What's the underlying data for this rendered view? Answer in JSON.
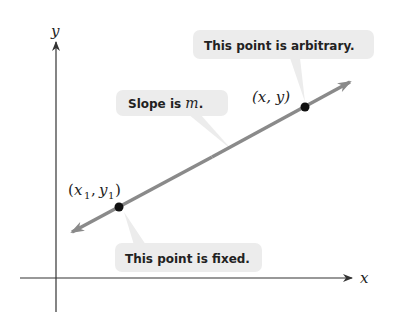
{
  "axes": {
    "x_label": "x",
    "y_label": "y"
  },
  "line": {
    "color": "#8a8a8a",
    "description": "Slope is m."
  },
  "points": {
    "fixed": {
      "label_var1": "x",
      "label_sub1": "1",
      "label_var2": "y",
      "label_sub2": "1"
    },
    "arbitrary": {
      "label": "(x, y)"
    }
  },
  "callouts": {
    "arbitrary": "This point is arbitrary.",
    "slope_prefix": "Slope is ",
    "slope_var": "m",
    "slope_suffix": ".",
    "fixed": "This point is fixed."
  },
  "colors": {
    "callout_bg": "#ececec",
    "axis": "#333333",
    "point": "#111111"
  }
}
